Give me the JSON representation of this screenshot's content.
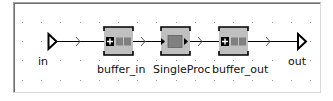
{
  "diagram": {
    "background": "#ffffff",
    "grid_color": "#9a9a9a",
    "line_color": "#000000",
    "block_fill": "#c0c0c0",
    "nodes": [
      {
        "id": "in",
        "type": "input-port",
        "label": "in"
      },
      {
        "id": "buffer_in",
        "type": "buffer",
        "label": "buffer_in"
      },
      {
        "id": "SingleProc",
        "type": "single-proc",
        "label": "SingleProc"
      },
      {
        "id": "buffer_out",
        "type": "buffer",
        "label": "buffer_out"
      },
      {
        "id": "out",
        "type": "output-port",
        "label": "out"
      }
    ],
    "connections": [
      {
        "from": "in",
        "to": "buffer_in"
      },
      {
        "from": "buffer_in",
        "to": "SingleProc"
      },
      {
        "from": "SingleProc",
        "to": "buffer_out"
      },
      {
        "from": "buffer_out",
        "to": "out"
      }
    ]
  }
}
